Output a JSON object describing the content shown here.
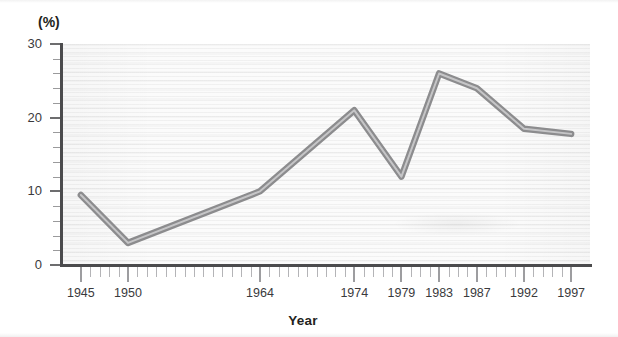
{
  "chart_data": {
    "type": "line",
    "title": "",
    "subtitle": "",
    "xlabel": "Year",
    "ylabel": "(%)",
    "unit_label": "(%)",
    "x": [
      1945,
      1950,
      1964,
      1974,
      1979,
      1983,
      1987,
      1992,
      1997
    ],
    "values": [
      9.5,
      3.0,
      10.0,
      21.0,
      12.0,
      26.0,
      24.0,
      18.5,
      17.8
    ],
    "series": [
      {
        "name": "percentage",
        "color": "#8c8c8e",
        "values": [
          9.5,
          3.0,
          10.0,
          21.0,
          12.0,
          26.0,
          24.0,
          18.5,
          17.8
        ]
      }
    ],
    "xlim": [
      1943,
      1999
    ],
    "ylim": [
      0,
      30
    ],
    "y_ticks": [
      0,
      10,
      20,
      30
    ],
    "y_tick_labels": [
      "0",
      "10",
      "20",
      "30"
    ],
    "y_minor_step": 2,
    "x_tick_labels": [
      "1945",
      "1950",
      "1964",
      "1974",
      "1979",
      "1983",
      "1987",
      "1992",
      "1997"
    ],
    "x_minor_step": 1,
    "grid": false,
    "legend": "none",
    "annotations": []
  },
  "axis": {
    "y_unit": "(%)",
    "x_title": "Year"
  },
  "style": {
    "line_color": "#8c8c8e",
    "line_highlight": "#d8d8da",
    "axis_color": "#4b4b4d",
    "tick_color": "#9d9da0",
    "text_color": "#231f20",
    "plot_background": "#fbfbfb",
    "page_background": "#ffffff"
  }
}
